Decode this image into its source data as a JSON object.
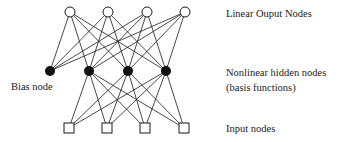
{
  "diagram": {
    "type": "neural-network",
    "labels": {
      "output_layer": "Linear Ouput Nodes",
      "hidden_layer_line1": "Nonlinear hidden nodes",
      "hidden_layer_line2": "(basis functions)",
      "input_layer": "Input nodes",
      "bias": "Bias node"
    },
    "layers": {
      "output": {
        "shape": "open-circle",
        "count": 4,
        "x": [
          70,
          108,
          147,
          185
        ],
        "y": 12
      },
      "hidden": {
        "shape": "filled-circle",
        "count": 4,
        "x": [
          50,
          89,
          128,
          166
        ],
        "y": 71,
        "bias_index": 0
      },
      "input": {
        "shape": "open-square",
        "count": 4,
        "x": [
          69,
          107,
          145,
          184
        ],
        "y": 128
      }
    },
    "connections": {
      "hidden_to_output": "all hidden (incl. bias) to all outputs",
      "input_to_hidden": "all inputs to non-bias hidden nodes"
    },
    "colors": {
      "stroke": "#1a1a1a",
      "fill_hidden": "#111111",
      "background": "#ffffff"
    }
  }
}
